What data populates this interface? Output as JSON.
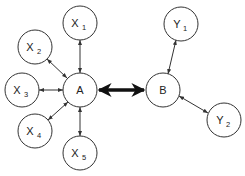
{
  "diagram": {
    "type": "graph",
    "nodes": [
      {
        "id": "X1",
        "label": "X",
        "sub": "1",
        "cx": 80,
        "cy": 23
      },
      {
        "id": "X2",
        "label": "X",
        "sub": "2",
        "cx": 35,
        "cy": 47
      },
      {
        "id": "X3",
        "label": "X",
        "sub": "3",
        "cx": 22,
        "cy": 90
      },
      {
        "id": "X4",
        "label": "X",
        "sub": "4",
        "cx": 35,
        "cy": 131
      },
      {
        "id": "X5",
        "label": "X",
        "sub": "5",
        "cx": 80,
        "cy": 153
      },
      {
        "id": "A",
        "label": "A",
        "sub": "",
        "cx": 80,
        "cy": 90
      },
      {
        "id": "B",
        "label": "B",
        "sub": "",
        "cx": 163,
        "cy": 90
      },
      {
        "id": "Y1",
        "label": "Y",
        "sub": "1",
        "cx": 181,
        "cy": 24
      },
      {
        "id": "Y2",
        "label": "Y",
        "sub": "2",
        "cx": 224,
        "cy": 120
      }
    ],
    "node_radius": 17,
    "edges": [
      {
        "from": "A",
        "to": "X1",
        "style": "bidirectional-thin"
      },
      {
        "from": "A",
        "to": "X2",
        "style": "bidirectional-thin"
      },
      {
        "from": "A",
        "to": "X3",
        "style": "bidirectional-thin"
      },
      {
        "from": "A",
        "to": "X4",
        "style": "bidirectional-thin"
      },
      {
        "from": "A",
        "to": "X5",
        "style": "bidirectional-thin"
      },
      {
        "from": "A",
        "to": "B",
        "style": "bidirectional-thick"
      },
      {
        "from": "B",
        "to": "Y1",
        "style": "bidirectional-thin"
      },
      {
        "from": "B",
        "to": "Y2",
        "style": "bidirectional-thin"
      }
    ]
  },
  "labels": {
    "X1": "X",
    "X1_sub": "1",
    "X2": "X",
    "X2_sub": "2",
    "X3": "X",
    "X3_sub": "3",
    "X4": "X",
    "X4_sub": "4",
    "X5": "X",
    "X5_sub": "5",
    "A": "A",
    "B": "B",
    "Y1": "Y",
    "Y1_sub": "1",
    "Y2": "Y",
    "Y2_sub": "2"
  },
  "colors": {
    "stroke": "#333333",
    "thick_arrow": "#111111",
    "background": "#ffffff"
  }
}
